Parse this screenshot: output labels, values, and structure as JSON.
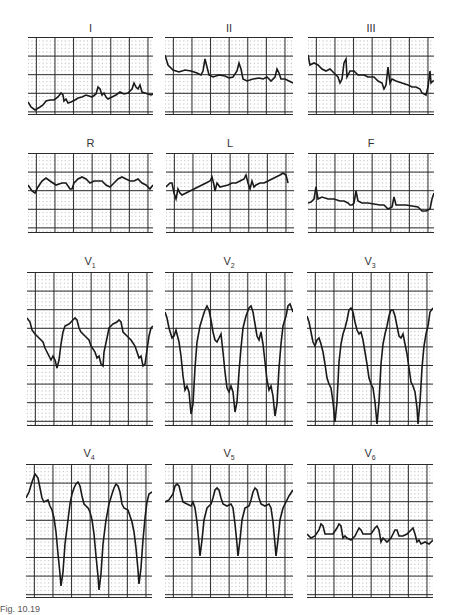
{
  "figure": {
    "caption": "Fig. 10.19",
    "colors": {
      "trace": "#1a1a1a",
      "major_grid": "#2a2a2a",
      "minor_grid": "#9a9a9a",
      "background": "#ffffff"
    },
    "leads": [
      {
        "id": "I",
        "label": "I",
        "sub": ""
      },
      {
        "id": "II",
        "label": "II",
        "sub": ""
      },
      {
        "id": "III",
        "label": "III",
        "sub": ""
      },
      {
        "id": "R",
        "label": "R",
        "sub": ""
      },
      {
        "id": "L",
        "label": "L",
        "sub": ""
      },
      {
        "id": "F",
        "label": "F",
        "sub": ""
      },
      {
        "id": "V1",
        "label": "V",
        "sub": "1"
      },
      {
        "id": "V2",
        "label": "V",
        "sub": "2"
      },
      {
        "id": "V3",
        "label": "V",
        "sub": "3"
      },
      {
        "id": "V4",
        "label": "V",
        "sub": "4"
      },
      {
        "id": "V5",
        "label": "V",
        "sub": "5"
      },
      {
        "id": "V6",
        "label": "V",
        "sub": "6"
      }
    ]
  }
}
